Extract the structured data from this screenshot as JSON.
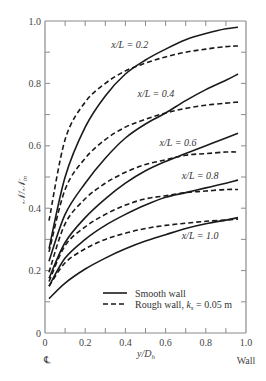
{
  "chart_data": {
    "type": "line",
    "title": "",
    "xlabel": "y/D_h",
    "ylabel": "N/N_in",
    "xlim": [
      0,
      1.0
    ],
    "ylim": [
      0,
      1.0
    ],
    "grid": false,
    "x_ticks": [
      "0",
      "0.2",
      "0.4",
      "0.6",
      "0.8",
      "1.0"
    ],
    "y_ticks": [
      "0",
      "0.2",
      "0.4",
      "0.6",
      "0.8",
      "1.0"
    ],
    "x_axis_annotations": {
      "left": "℄",
      "right": "Wall"
    },
    "legend": {
      "position": "lower right",
      "entries": [
        {
          "label": "Smooth wall",
          "style": "solid"
        },
        {
          "label": "Rough wall, k_s = 0.05 m",
          "style": "dashed"
        }
      ]
    },
    "x": [
      0.02,
      0.1,
      0.2,
      0.3,
      0.4,
      0.5,
      0.6,
      0.7,
      0.8,
      0.9,
      0.96
    ],
    "series": [
      {
        "name": "Smooth wall, x/L = 0.2",
        "style": "solid",
        "values": [
          0.27,
          0.5,
          0.66,
          0.76,
          0.83,
          0.875,
          0.91,
          0.94,
          0.96,
          0.975,
          0.98
        ]
      },
      {
        "name": "Rough wall, x/L = 0.2",
        "style": "dashed",
        "values": [
          0.36,
          0.62,
          0.74,
          0.8,
          0.84,
          0.865,
          0.885,
          0.9,
          0.91,
          0.918,
          0.92
        ]
      },
      {
        "name": "Smooth wall, x/L = 0.4",
        "style": "solid",
        "values": [
          0.23,
          0.38,
          0.48,
          0.56,
          0.625,
          0.67,
          0.705,
          0.745,
          0.78,
          0.81,
          0.83
        ]
      },
      {
        "name": "Rough wall, x/L = 0.4",
        "style": "dashed",
        "values": [
          0.26,
          0.46,
          0.56,
          0.62,
          0.66,
          0.685,
          0.705,
          0.72,
          0.73,
          0.737,
          0.74
        ]
      },
      {
        "name": "Smooth wall, x/L = 0.6",
        "style": "solid",
        "values": [
          0.175,
          0.29,
          0.37,
          0.43,
          0.48,
          0.52,
          0.55,
          0.575,
          0.6,
          0.625,
          0.64
        ]
      },
      {
        "name": "Rough wall, x/L = 0.6",
        "style": "dashed",
        "values": [
          0.195,
          0.35,
          0.43,
          0.48,
          0.515,
          0.54,
          0.555,
          0.57,
          0.575,
          0.58,
          0.58
        ]
      },
      {
        "name": "Smooth wall, x/L = 0.8",
        "style": "solid",
        "values": [
          0.15,
          0.24,
          0.3,
          0.345,
          0.38,
          0.41,
          0.435,
          0.45,
          0.465,
          0.48,
          0.49
        ]
      },
      {
        "name": "Rough wall, x/L = 0.8",
        "style": "dashed",
        "values": [
          0.165,
          0.28,
          0.34,
          0.38,
          0.41,
          0.43,
          0.44,
          0.45,
          0.455,
          0.46,
          0.46
        ]
      },
      {
        "name": "Smooth wall, x/L = 1.0",
        "style": "solid",
        "values": [
          0.11,
          0.16,
          0.205,
          0.24,
          0.27,
          0.295,
          0.315,
          0.335,
          0.35,
          0.362,
          0.37
        ]
      },
      {
        "name": "Rough wall, x/L = 1.0",
        "style": "dashed",
        "values": [
          0.15,
          0.225,
          0.27,
          0.3,
          0.32,
          0.335,
          0.345,
          0.352,
          0.358,
          0.362,
          0.365
        ]
      }
    ],
    "annotations": [
      {
        "text": "x/L = 0.2",
        "x": 0.33,
        "y": 0.915
      },
      {
        "text": "x/L = 0.4",
        "x": 0.46,
        "y": 0.755
      },
      {
        "text": "x/L = 0.6",
        "x": 0.57,
        "y": 0.6
      },
      {
        "text": "x/L = 0.8",
        "x": 0.68,
        "y": 0.495
      },
      {
        "text": "x/L = 1.0",
        "x": 0.68,
        "y": 0.3
      }
    ]
  },
  "labels": {
    "ylabel_main": "𝒩",
    "ylabel_sep": "/",
    "ylabel_den": "𝒩",
    "ylabel_sub": "in",
    "xlabel_main": "y",
    "xlabel_sep": "/",
    "xlabel_den": "D",
    "xlabel_sub": "h",
    "centerline": "℄",
    "wall": "Wall",
    "legend_smooth": "Smooth wall",
    "legend_rough_prefix": "Rough wall, ",
    "legend_rough_k": "k",
    "legend_rough_sub": "s",
    "legend_rough_suffix": " = 0.05 m"
  },
  "colors": {
    "axis": "#8a8a8a",
    "curve": "#1a1a1a",
    "text": "#333333"
  }
}
